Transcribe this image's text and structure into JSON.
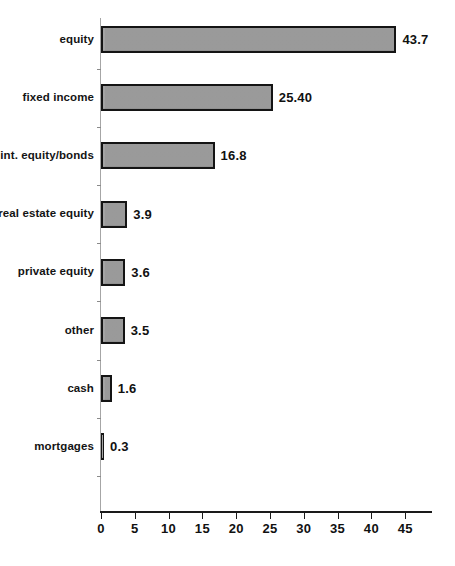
{
  "chart_data": {
    "type": "bar",
    "orientation": "horizontal",
    "title": "",
    "subtitle": "",
    "xlabel": "",
    "ylabel": "",
    "xlim": [
      0,
      49
    ],
    "grid": false,
    "legend": null,
    "xticks": [
      0,
      5,
      10,
      15,
      20,
      25,
      30,
      35,
      40,
      45
    ],
    "xtick_labels": [
      "0",
      "5",
      "10",
      "15",
      "20",
      "25",
      "30",
      "35",
      "40",
      "45"
    ],
    "categories": [
      "equity",
      "fixed income",
      "int. equity/bonds",
      "real estate equity",
      "private equity",
      "other",
      "cash",
      "mortgages"
    ],
    "values": [
      43.7,
      25.4,
      16.8,
      3.9,
      3.6,
      3.5,
      1.6,
      0.3
    ],
    "data_labels": [
      "43.7",
      "25.40",
      "16.8",
      "3.9",
      "3.6",
      "3.5",
      "1.6",
      "0.3"
    ],
    "bar_fill_color": "#9b9b9b",
    "bar_edge_color": "#141414",
    "axis_color": "#1a1a1a",
    "background_color": "#ffffff"
  }
}
